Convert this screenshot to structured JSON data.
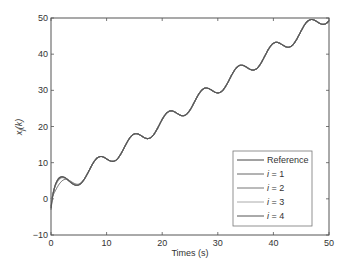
{
  "chart_data": {
    "type": "line",
    "title": "",
    "xlabel": "Times (s)",
    "ylabel": "x_j(k)",
    "xlim": [
      0,
      50
    ],
    "ylim": [
      -10,
      50
    ],
    "xticks": [
      0,
      10,
      20,
      30,
      40,
      50
    ],
    "yticks": [
      -10,
      0,
      10,
      20,
      30,
      40,
      50
    ],
    "grid": false,
    "legend_position": "lower right",
    "x": [
      0,
      1.5,
      3.5,
      5,
      8.5,
      10.5,
      15,
      17,
      21.5,
      23.5,
      27.5,
      30,
      34,
      36,
      40,
      42.5,
      46.5,
      48.5,
      50
    ],
    "series": [
      {
        "name": "Reference",
        "color": "#444444",
        "values": [
          0,
          3.0,
          3.0,
          3.1,
          10.1,
          9.6,
          16.3,
          15.1,
          22.5,
          21.5,
          28.7,
          28.0,
          35.0,
          34.0,
          41.5,
          40.5,
          47.5,
          46.7,
          49.5
        ]
      },
      {
        "name": "i = 1",
        "color": "#666666",
        "values": [
          -3,
          7.0,
          2.0,
          3.1,
          10.1,
          9.6,
          16.3,
          15.1,
          22.5,
          21.5,
          28.7,
          28.0,
          35.0,
          34.0,
          41.5,
          40.5,
          47.5,
          46.7,
          49.5
        ]
      },
      {
        "name": "i = 2",
        "color": "#777777",
        "values": [
          -2,
          6.5,
          2.2,
          3.1,
          10.1,
          9.6,
          16.3,
          15.1,
          22.5,
          21.5,
          28.7,
          28.0,
          35.0,
          34.0,
          41.5,
          40.5,
          47.5,
          46.7,
          49.5
        ]
      },
      {
        "name": "i = 3",
        "color": "#999999",
        "values": [
          -1,
          6.0,
          2.4,
          3.1,
          10.1,
          9.6,
          16.3,
          15.1,
          22.5,
          21.5,
          28.7,
          28.0,
          35.0,
          34.0,
          41.5,
          40.5,
          47.5,
          46.7,
          49.5
        ]
      },
      {
        "name": "i = 4",
        "color": "#555555",
        "values": [
          -2.5,
          6.8,
          2.1,
          3.1,
          10.1,
          9.6,
          16.3,
          15.1,
          22.5,
          21.5,
          28.7,
          28.0,
          35.0,
          34.0,
          41.5,
          40.5,
          47.5,
          46.7,
          49.5
        ]
      }
    ]
  },
  "legend": {
    "items": [
      {
        "label": "Reference",
        "color": "#444444"
      },
      {
        "label": "i = 1",
        "color": "#666666"
      },
      {
        "label": "i = 2",
        "color": "#777777"
      },
      {
        "label": "i = 3",
        "color": "#aaaaaa"
      },
      {
        "label": "i = 4",
        "color": "#555555"
      }
    ]
  },
  "axes": {
    "xlabel": "Times (s)",
    "ylabel_main": "x",
    "ylabel_sub": "j",
    "ylabel_arg": "(k)",
    "xtick_labels": [
      "0",
      "10",
      "20",
      "30",
      "40",
      "50"
    ],
    "ytick_labels": [
      "−10",
      "0",
      "10",
      "20",
      "30",
      "40",
      "50"
    ]
  }
}
